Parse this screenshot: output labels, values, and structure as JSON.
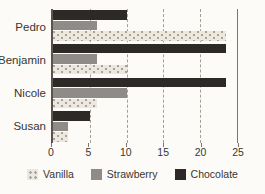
{
  "chart_data": {
    "type": "bar",
    "orientation": "horizontal",
    "title": "",
    "xlabel": "",
    "ylabel": "",
    "categories": [
      "Pedro",
      "Benjamin",
      "Nicole",
      "Susan"
    ],
    "series": [
      {
        "name": "Vanilla",
        "pattern": "dots",
        "color": "#ece8df",
        "dot_color": "#aaa396",
        "values": [
          23.5,
          10,
          6,
          2
        ]
      },
      {
        "name": "Strawberry",
        "pattern": "solid",
        "color": "#8f8b88",
        "values": [
          6,
          6,
          10,
          2
        ]
      },
      {
        "name": "Chocolate",
        "pattern": "solid",
        "color": "#2d2926",
        "values": [
          10,
          23.5,
          23.5,
          5
        ]
      }
    ],
    "group_order_top_to_bottom": [
      "Chocolate",
      "Strawberry",
      "Vanilla"
    ],
    "xlim": [
      0,
      25
    ],
    "x_ticks": [
      "0",
      "5",
      "10",
      "15",
      "20",
      "25"
    ],
    "grid": "dashed-vertical",
    "legend_position": "bottom"
  },
  "colors": {
    "background": "#fcfbf8",
    "axis_left": "#5a544d",
    "axis_right": "#7b766f",
    "gridline": "#a49f97",
    "text": "#3a3530"
  }
}
